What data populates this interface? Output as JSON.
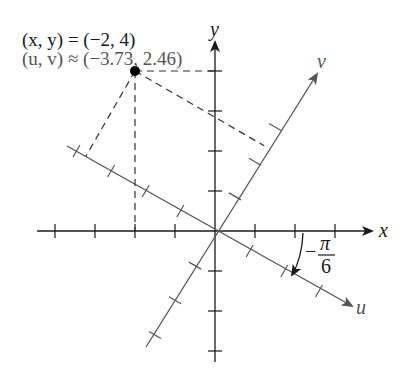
{
  "diagram": {
    "origin_px": [
      215,
      231
    ],
    "unit_px": 40,
    "rotation_angle": "-π/6",
    "point": {
      "x": -2,
      "y": 4,
      "u": -3.73,
      "v": 2.46
    },
    "labels": {
      "xy_eq": "(x, y) = (−2, 4)",
      "uv_eq": "(u, v) ≈ (−3.73, 2.46)",
      "x_axis": "x",
      "y_axis": "y",
      "u_axis": "u",
      "v_axis": "v",
      "angle_sign": "−",
      "angle_num": "π",
      "angle_den": "6"
    },
    "colors": {
      "axis": "#1a1a1a",
      "rotated_axis": "#555555",
      "dashed": "#333333",
      "point": "#000000",
      "uv_text": "#555555"
    },
    "x_ticks": [
      -4,
      -3,
      -2,
      -1,
      1,
      2,
      3
    ],
    "y_ticks": [
      -3,
      -2,
      -1,
      1,
      2,
      3,
      4
    ],
    "u_ticks": [
      -4,
      -3,
      -2,
      -1,
      1,
      2,
      3
    ],
    "v_ticks": [
      -3,
      -2,
      -1,
      1,
      2,
      3
    ]
  }
}
